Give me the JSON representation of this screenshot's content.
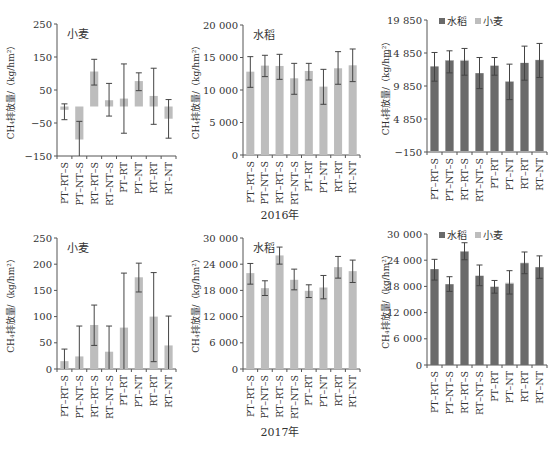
{
  "figure": {
    "year_labels": [
      "2016年",
      "2017年"
    ],
    "y_axis_label": "CH₄排放量/（kg/hm²）"
  },
  "colors": {
    "single_bar": "#bdbdbd",
    "rice": "#6a6a6a",
    "wheat": "#bdbdbd",
    "error_bar": "#444444",
    "axis": "#555555"
  },
  "chart_data": [
    {
      "id": "2016-wheat",
      "type": "bar",
      "title": "小麦",
      "year": "2016年",
      "categories": [
        "PT–RT–S",
        "PT–NT–S",
        "RT–RT–S",
        "RT–NT–S",
        "PT–RT",
        "PT–NT",
        "RT–RT",
        "RT–NT"
      ],
      "ylabel": "CH₄排放量/（kg/hm²）",
      "ylim": [
        -150,
        250
      ],
      "yticks": [
        -150,
        -50,
        50,
        150,
        250
      ],
      "ytick_labels": [
        "−150",
        "−50",
        "50",
        "150",
        "250"
      ],
      "series": [
        {
          "name": "小麦",
          "values": [
            -10,
            -100,
            106,
            19,
            24,
            77,
            32,
            -37
          ],
          "err_low": [
            -40,
            -160,
            65,
            -29,
            -81,
            48,
            -54,
            -96
          ],
          "err_high": [
            8,
            -45,
            143,
            70,
            129,
            102,
            116,
            21
          ]
        }
      ],
      "legend": null,
      "grid": false
    },
    {
      "id": "2016-rice",
      "type": "bar",
      "title": "水稻",
      "year": "2016年",
      "categories": [
        "PT–RT–S",
        "PT–NT–S",
        "RT–RT–S",
        "RT–NT–S",
        "PT–RT",
        "PT–NT",
        "RT–RT",
        "RT–NT"
      ],
      "ylabel": "CH₄排放量/（kg/hm²）",
      "ylim": [
        0,
        20000
      ],
      "yticks": [
        0,
        5000,
        10000,
        15000,
        20000
      ],
      "ytick_labels": [
        "0",
        "5 000",
        "10 000",
        "15 000",
        "20 000"
      ],
      "series": [
        {
          "name": "水稻",
          "values": [
            12820,
            13750,
            13700,
            11800,
            12930,
            10520,
            13340,
            13800
          ],
          "err_low": [
            10410,
            12060,
            11640,
            9340,
            11540,
            7800,
            10880,
            11290
          ],
          "err_high": [
            15130,
            15340,
            15490,
            14100,
            14100,
            13180,
            15900,
            16310
          ]
        }
      ],
      "legend": null,
      "grid": false
    },
    {
      "id": "2016-annual",
      "type": "bar",
      "stacked": true,
      "title": "",
      "year": "2016年",
      "categories": [
        "PT–RT–S",
        "PT–NT–S",
        "RT–RT–S",
        "RT–NT–S",
        "PT–RT",
        "PT–NT",
        "RT–RT",
        "RT–NT"
      ],
      "ylabel": "CH₄排放量/（kg/hm²）",
      "ylim": [
        -150,
        19850
      ],
      "yticks": [
        -150,
        4850,
        9850,
        14850,
        19850
      ],
      "ytick_labels": [
        "−150",
        "4 850",
        "9 850",
        "14 850",
        "19 850"
      ],
      "series": [
        {
          "name": "水稻",
          "values": [
            12820,
            13750,
            13700,
            11800,
            12930,
            10520,
            13340,
            13800
          ]
        },
        {
          "name": "小麦",
          "values": [
            -10,
            -100,
            106,
            19,
            24,
            77,
            32,
            -37
          ]
        }
      ],
      "total_err_low": [
        10580,
        11840,
        11490,
        9460,
        11490,
        7790,
        10730,
        11140
      ],
      "total_err_high": [
        14930,
        15180,
        15540,
        14170,
        14170,
        13160,
        15890,
        16300
      ],
      "legend": {
        "position": "top",
        "entries": [
          "水稻",
          "小麦"
        ]
      },
      "grid": false
    },
    {
      "id": "2017-wheat",
      "type": "bar",
      "title": "小麦",
      "year": "2017年",
      "categories": [
        "PT–RT–S",
        "PT–NT–S",
        "RT–RT–S",
        "RT–NT–S",
        "PT–RT",
        "PT–NT",
        "RT–RT",
        "RT–NT"
      ],
      "ylabel": "CH₄排放量/（kg/hm²）",
      "ylim": [
        0,
        250
      ],
      "yticks": [
        0,
        50,
        100,
        150,
        200,
        250
      ],
      "ytick_labels": [
        "0",
        "50",
        "100",
        "150",
        "200",
        "250"
      ],
      "series": [
        {
          "name": "小麦",
          "values": [
            15,
            24,
            84,
            33,
            79,
            175,
            100,
            45
          ],
          "err_low": [
            0,
            0,
            45,
            0,
            0,
            147,
            14,
            0
          ],
          "err_high": [
            38,
            82,
            122,
            82,
            183,
            202,
            184,
            101
          ]
        }
      ],
      "legend": null,
      "grid": false
    },
    {
      "id": "2017-rice",
      "type": "bar",
      "title": "水稻",
      "year": "2017年",
      "categories": [
        "PT–RT–S",
        "PT–NT–S",
        "RT–RT–S",
        "RT–NT–S",
        "PT–RT",
        "PT–NT",
        "RT–RT",
        "RT–NT"
      ],
      "ylabel": "CH₄排放量/（kg/hm²）",
      "ylim": [
        0,
        30000
      ],
      "yticks": [
        0,
        6000,
        12000,
        18000,
        24000,
        30000
      ],
      "ytick_labels": [
        "0",
        "6 000",
        "12 000",
        "18 000",
        "24 000",
        "30 000"
      ],
      "series": [
        {
          "name": "水稻",
          "values": [
            21960,
            18510,
            26010,
            20430,
            17900,
            18670,
            23330,
            22410
          ],
          "err_low": [
            19430,
            16830,
            24020,
            18130,
            16370,
            16070,
            20810,
            19810
          ],
          "err_high": [
            24170,
            20200,
            27920,
            22870,
            19280,
            21420,
            25780,
            24940
          ]
        }
      ],
      "legend": null,
      "grid": false
    },
    {
      "id": "2017-annual",
      "type": "bar",
      "stacked": true,
      "title": "",
      "year": "2017年",
      "categories": [
        "PT–RT–S",
        "PT–NT–S",
        "RT–RT–S",
        "RT–NT–S",
        "PT–RT",
        "PT–NT",
        "RT–RT",
        "RT–NT"
      ],
      "ylabel": "CH₄排放量/（kg/hm²）",
      "ylim": [
        0,
        30000
      ],
      "yticks": [
        0,
        6000,
        12000,
        18000,
        24000,
        30000
      ],
      "ytick_labels": [
        "0",
        "6 000",
        "12 000",
        "18 000",
        "24 000",
        "30 000"
      ],
      "series": [
        {
          "name": "水稻",
          "values": [
            21960,
            18510,
            26010,
            20430,
            17900,
            18670,
            23330,
            22410
          ]
        },
        {
          "name": "小麦",
          "values": [
            15,
            24,
            84,
            33,
            79,
            175,
            100,
            45
          ]
        }
      ],
      "total_err_low": [
        19450,
        16850,
        24100,
        18160,
        16450,
        16250,
        20910,
        19850
      ],
      "total_err_high": [
        24200,
        20220,
        28000,
        22900,
        19360,
        21600,
        25880,
        24990
      ],
      "legend": {
        "position": "top",
        "entries": [
          "水稻",
          "小麦"
        ]
      },
      "grid": false
    }
  ]
}
